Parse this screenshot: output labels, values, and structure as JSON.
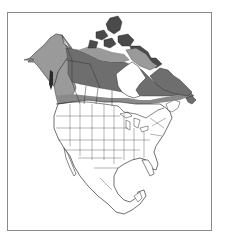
{
  "map": {
    "title": "",
    "region": "North America",
    "description": "Range map shading across Alaska and northern Canada",
    "colors": {
      "background": "#ffffff",
      "frame": "#8a8a8a",
      "land": "#ffffff",
      "outline": "#333333",
      "range_light": "#9a9a9a",
      "range_dark": "#6e6e6e",
      "islands_dark": "#3a3a3a"
    },
    "legend": {
      "light_label": "",
      "dark_label": ""
    }
  }
}
